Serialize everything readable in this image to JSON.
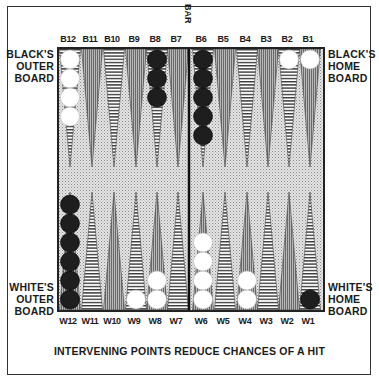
{
  "caption": "INTERVENING POINTS REDUCE CHANCES OF A HIT",
  "bar_label": "BAR",
  "labels": {
    "black_outer": [
      "BLACK'S",
      "OUTER",
      "BOARD"
    ],
    "black_home": [
      "BLACK'S",
      "HOME",
      "BOARD"
    ],
    "white_outer": [
      "WHITE'S",
      "OUTER",
      "BOARD"
    ],
    "white_home": [
      "WHITE'S",
      "HOME",
      "BOARD"
    ]
  },
  "top_points": [
    "B12",
    "B11",
    "B10",
    "B9",
    "B8",
    "B7",
    "B6",
    "B5",
    "B4",
    "B3",
    "B2",
    "B1"
  ],
  "bottom_points": [
    "W12",
    "W11",
    "W10",
    "W9",
    "W8",
    "W7",
    "W6",
    "W5",
    "W4",
    "W3",
    "W2",
    "W1"
  ],
  "colors": {
    "black_checker": "#1e1e1e",
    "white_checker": "#ffffff",
    "board_bg": "#d8d8d8",
    "gray_point": "#9a9a9a"
  },
  "checkers": {
    "top": {
      "B12": {
        "color": "white",
        "count": 4
      },
      "B8": {
        "color": "black",
        "count": 3
      },
      "B6": {
        "color": "black",
        "count": 5
      },
      "B2": {
        "color": "white",
        "count": 1
      },
      "B1": {
        "color": "white",
        "count": 1
      }
    },
    "bottom": {
      "W12": {
        "color": "black",
        "count": 6
      },
      "W9": {
        "color": "white",
        "count": 1
      },
      "W8": {
        "color": "white",
        "count": 2
      },
      "W6": {
        "color": "white",
        "count": 4
      },
      "W4": {
        "color": "white",
        "count": 2
      },
      "W1": {
        "color": "black",
        "count": 1
      }
    }
  }
}
